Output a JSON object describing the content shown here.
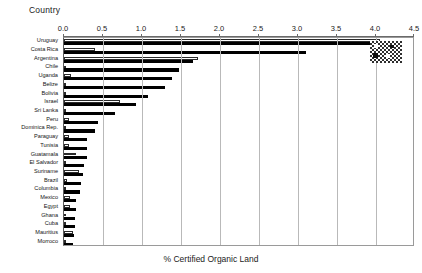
{
  "chart_data": {
    "type": "bar",
    "orientation": "horizontal",
    "title": "Country",
    "xlabel": "% Certified Organic Land",
    "ylabel": "Country",
    "xlim": [
      0.0,
      4.5
    ],
    "xticks": [
      "0.0",
      "0.5",
      "1.0",
      "1.5",
      "2.0",
      "2.5",
      "3.0",
      "3.5",
      "4.0",
      "4.5"
    ],
    "grid": true,
    "legend": "pattern-swatch",
    "categories": [
      "Uruguay",
      "Costa Rica",
      "Argentina",
      "Chile",
      "Uganda",
      "Belize",
      "Bolivia",
      "Israel",
      "Sri Lanka",
      "Peru",
      "Dominica Rep.",
      "Paraguay",
      "Tunisia",
      "Guatamala",
      "El Salvador",
      "Suriname",
      "Brazil",
      "Columbia",
      "Mexico",
      "Egypt",
      "Ghana",
      "Cuba",
      "Mauritius",
      "Morroco"
    ],
    "series": [
      {
        "name": "white-bar",
        "style": "open",
        "values": [
          4.05,
          0.4,
          1.72,
          0.03,
          0.09,
          0.0,
          0.02,
          0.72,
          0.02,
          0.06,
          0.0,
          0.07,
          0.06,
          0.16,
          0.0,
          0.19,
          0.04,
          0.0,
          0.08,
          0.08,
          0.0,
          0.0,
          0.12,
          0.0
        ]
      },
      {
        "name": "black-bar",
        "style": "filled",
        "values": [
          4.0,
          3.1,
          1.65,
          1.48,
          1.38,
          1.3,
          1.08,
          0.92,
          0.65,
          0.43,
          0.4,
          0.3,
          0.3,
          0.3,
          0.25,
          0.24,
          0.22,
          0.2,
          0.16,
          0.15,
          0.14,
          0.14,
          0.13,
          0.12
        ]
      }
    ]
  },
  "axis": {
    "x_caption": "% Certified Organic Land",
    "y_caption": "Country"
  }
}
